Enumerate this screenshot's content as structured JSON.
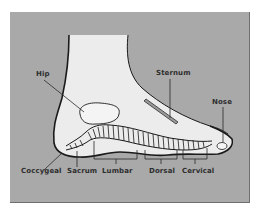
{
  "diagram": {
    "colors": {
      "background_panel": "#a9a9a9",
      "foot_fill": "#ececec",
      "outline": "#1a1a1a",
      "label_text": "#2e2e2e"
    },
    "labels": {
      "hip": "Hip",
      "sternum": "Sternum",
      "nose": "Nose",
      "coccygeal": "Coccygeal",
      "sacrum": "Sacrum",
      "lumbar": "Lumbar",
      "dorsal": "Dorsal",
      "cervical": "Cervical"
    }
  }
}
